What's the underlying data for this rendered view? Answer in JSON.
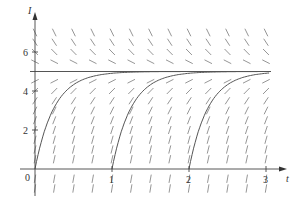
{
  "chart_data": {
    "type": "line",
    "title": "",
    "subtitle": "",
    "xlabel": "t",
    "ylabel": "I",
    "xlim": [
      0,
      3.2
    ],
    "ylim": [
      -1,
      7.5
    ],
    "x_ticks": [
      1,
      2,
      3
    ],
    "y_ticks": [
      2,
      4,
      6
    ],
    "origin_label": "0",
    "grid": false,
    "legend": null,
    "slope_field": {
      "equation": "dI/dt = 4(5 - I)",
      "t_values": [
        0,
        0.25,
        0.5,
        0.75,
        1,
        1.25,
        1.5,
        1.75,
        2,
        2.25,
        2.5,
        2.75,
        3
      ],
      "I_values": [
        -1,
        -0.5,
        0.5,
        1,
        1.5,
        2,
        2.5,
        3,
        3.5,
        4,
        4.5,
        5.5,
        6,
        6.5,
        7
      ]
    },
    "equilibrium": {
      "name": "I = 5",
      "value": 5
    },
    "series": [
      {
        "name": "solution t0=0",
        "t0": 0,
        "x": [
          0,
          0.1,
          0.2,
          0.3,
          0.5,
          0.75,
          1,
          1.5,
          2,
          3
        ],
        "values": [
          0,
          1.65,
          2.75,
          3.49,
          4.32,
          4.75,
          4.91,
          4.99,
          5.0,
          5.0
        ]
      },
      {
        "name": "solution t0=1",
        "t0": 1,
        "x": [
          1,
          1.1,
          1.2,
          1.3,
          1.5,
          1.75,
          2,
          2.5,
          3
        ],
        "values": [
          0,
          1.65,
          2.75,
          3.49,
          4.32,
          4.75,
          4.91,
          4.99,
          5.0
        ]
      },
      {
        "name": "solution t0=2",
        "t0": 2,
        "x": [
          2,
          2.1,
          2.2,
          2.3,
          2.5,
          2.75,
          3
        ],
        "values": [
          0,
          1.65,
          2.75,
          3.49,
          4.32,
          4.75,
          4.91
        ]
      }
    ]
  }
}
